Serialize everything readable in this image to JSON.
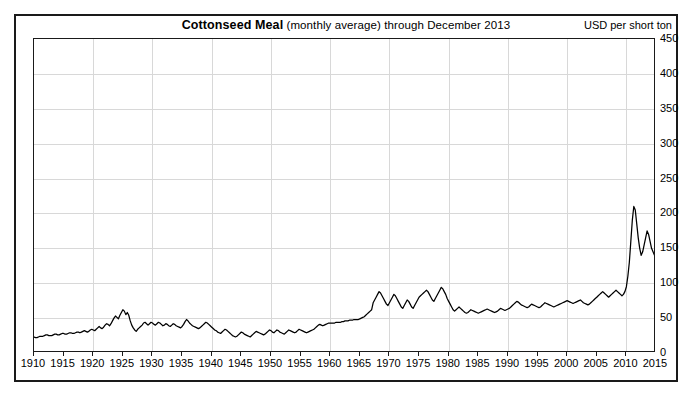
{
  "title": {
    "main": "Cottonseed Meal",
    "sub": "(monthly average) through December 2013"
  },
  "units_label": "USD per short ton",
  "chart_data": {
    "type": "line",
    "title": "Cottonseed Meal (monthly average) through December 2013",
    "xlabel": "",
    "ylabel": "USD per short ton",
    "xlim": [
      1910,
      2015
    ],
    "ylim": [
      0,
      450
    ],
    "grid": true,
    "legend": "none",
    "series_name": "Cottonseed Meal monthly average price",
    "x_ticks": [
      1910,
      1915,
      1920,
      1925,
      1930,
      1935,
      1940,
      1945,
      1950,
      1955,
      1960,
      1965,
      1970,
      1975,
      1980,
      1985,
      1990,
      1995,
      2000,
      2005,
      2010,
      2015
    ],
    "y_ticks": [
      0,
      50,
      100,
      150,
      200,
      250,
      300,
      350,
      400,
      450
    ],
    "x_start": 1910.0,
    "x_step": 0.25,
    "values": [
      23,
      22,
      22,
      23,
      24,
      24,
      24,
      25,
      26,
      26,
      25,
      25,
      25,
      26,
      27,
      27,
      26,
      26,
      27,
      28,
      28,
      27,
      27,
      28,
      29,
      29,
      28,
      28,
      29,
      30,
      30,
      29,
      30,
      31,
      32,
      31,
      30,
      31,
      33,
      34,
      33,
      32,
      34,
      36,
      38,
      36,
      35,
      37,
      40,
      42,
      41,
      39,
      42,
      46,
      50,
      53,
      51,
      49,
      54,
      58,
      62,
      60,
      55,
      58,
      54,
      46,
      40,
      36,
      33,
      31,
      34,
      36,
      38,
      40,
      43,
      44,
      42,
      40,
      42,
      44,
      43,
      41,
      40,
      42,
      44,
      43,
      41,
      39,
      40,
      42,
      41,
      39,
      38,
      40,
      42,
      41,
      39,
      38,
      37,
      36,
      38,
      41,
      45,
      48,
      46,
      43,
      41,
      39,
      38,
      37,
      36,
      35,
      36,
      38,
      40,
      42,
      44,
      43,
      41,
      39,
      37,
      35,
      33,
      32,
      30,
      29,
      28,
      30,
      32,
      34,
      33,
      31,
      29,
      27,
      25,
      24,
      23,
      24,
      26,
      28,
      30,
      29,
      27,
      26,
      25,
      24,
      23,
      25,
      27,
      29,
      31,
      30,
      29,
      28,
      27,
      26,
      27,
      29,
      31,
      33,
      32,
      30,
      29,
      31,
      33,
      32,
      30,
      29,
      28,
      27,
      29,
      31,
      33,
      32,
      31,
      30,
      29,
      30,
      32,
      34,
      33,
      32,
      31,
      30,
      29,
      30,
      31,
      32,
      33,
      34,
      36,
      38,
      40,
      41,
      40,
      39,
      40,
      41,
      42,
      43,
      43,
      43,
      43,
      43,
      44,
      44,
      44,
      44,
      45,
      45,
      46,
      46,
      46,
      47,
      47,
      47,
      48,
      48,
      48,
      48,
      49,
      50,
      51,
      52,
      54,
      56,
      58,
      60,
      62,
      72,
      76,
      80,
      84,
      88,
      86,
      82,
      78,
      74,
      70,
      68,
      72,
      76,
      80,
      84,
      82,
      78,
      74,
      70,
      66,
      64,
      68,
      72,
      76,
      74,
      70,
      66,
      64,
      68,
      72,
      76,
      80,
      82,
      84,
      86,
      88,
      90,
      88,
      84,
      80,
      76,
      74,
      78,
      82,
      86,
      90,
      94,
      92,
      88,
      84,
      78,
      74,
      70,
      66,
      62,
      60,
      62,
      64,
      66,
      64,
      62,
      60,
      58,
      57,
      58,
      60,
      62,
      61,
      60,
      59,
      58,
      57,
      58,
      59,
      60,
      61,
      62,
      63,
      62,
      61,
      60,
      59,
      58,
      59,
      60,
      62,
      64,
      63,
      62,
      61,
      62,
      63,
      64,
      66,
      68,
      70,
      72,
      74,
      73,
      71,
      69,
      68,
      67,
      66,
      65,
      66,
      68,
      70,
      69,
      68,
      67,
      66,
      65,
      66,
      68,
      70,
      72,
      71,
      70,
      69,
      68,
      67,
      66,
      67,
      68,
      69,
      70,
      71,
      72,
      73,
      74,
      75,
      74,
      73,
      72,
      71,
      72,
      73,
      74,
      75,
      76,
      74,
      72,
      71,
      70,
      69,
      70,
      72,
      74,
      76,
      78,
      80,
      82,
      84,
      86,
      88,
      86,
      84,
      82,
      80,
      82,
      84,
      86,
      88,
      90,
      88,
      86,
      84,
      82,
      84,
      88,
      95,
      110,
      130,
      160,
      190,
      210,
      205,
      185,
      165,
      150,
      140,
      145,
      155,
      165,
      175,
      170,
      160,
      150,
      145,
      140,
      138,
      142,
      150,
      160,
      168,
      165,
      158,
      150,
      145,
      142,
      140,
      138,
      140,
      145,
      155,
      170,
      185,
      195,
      200,
      195,
      185,
      175,
      168,
      160,
      155,
      150,
      148,
      152,
      160,
      170,
      178,
      185,
      190,
      185,
      175,
      165,
      160,
      158,
      162,
      170,
      180,
      190,
      198,
      205,
      210,
      205,
      195,
      185,
      178,
      170,
      165,
      168,
      175,
      185,
      195,
      205,
      215,
      225,
      228,
      220,
      208,
      195,
      182,
      170,
      160,
      152,
      148,
      145,
      148,
      155,
      165,
      175,
      185,
      195,
      205,
      218,
      228,
      225,
      215,
      200,
      188,
      178,
      172,
      168,
      165,
      162,
      158,
      152,
      145,
      138,
      130,
      122,
      115,
      112,
      118,
      125,
      132,
      140,
      148,
      155,
      160,
      158,
      152,
      148,
      145,
      148,
      152,
      158,
      165,
      172,
      178,
      182,
      185,
      180,
      172,
      165,
      158,
      152,
      148,
      150,
      155,
      162,
      170,
      178,
      185,
      192,
      198,
      205,
      210,
      205,
      196,
      186,
      176,
      168,
      162,
      158,
      155,
      152,
      150,
      152,
      156,
      160,
      164,
      168,
      170,
      168,
      164,
      160,
      156,
      152,
      150,
      152,
      156,
      160,
      165,
      170,
      175,
      172,
      168,
      164,
      160,
      158,
      156,
      158,
      162,
      168,
      175,
      180,
      184,
      180,
      175,
      168,
      162,
      158,
      155,
      158,
      162,
      166,
      170,
      172,
      170,
      166,
      162,
      158,
      155,
      152,
      150,
      152,
      155,
      158,
      162,
      166,
      170,
      168,
      164,
      160,
      156,
      152,
      150,
      148,
      146,
      145,
      148,
      152,
      156,
      162,
      168,
      175,
      182,
      188,
      195,
      200,
      198,
      192,
      185,
      178,
      172,
      166,
      160,
      155,
      150,
      145,
      140,
      136,
      132,
      130,
      128,
      126,
      125,
      126,
      128,
      132,
      136,
      140,
      142,
      140,
      136,
      132,
      130,
      132,
      136,
      140,
      145,
      150,
      155,
      158,
      155,
      150,
      145,
      140,
      136,
      132,
      130,
      128,
      126,
      125,
      124,
      122,
      120,
      118,
      116,
      115,
      114,
      116,
      118,
      120,
      122,
      124,
      126,
      125,
      123,
      120,
      118,
      116,
      115,
      118,
      122,
      128,
      135,
      142,
      150,
      158,
      165,
      172,
      178,
      182,
      180,
      175,
      168,
      160,
      152,
      145,
      140,
      136,
      132,
      130,
      128,
      126,
      125,
      128,
      132,
      138,
      145,
      152,
      160,
      168,
      172,
      168,
      160,
      152,
      145,
      140,
      138,
      140,
      145,
      152,
      160,
      170,
      180,
      190,
      198,
      205,
      210,
      208,
      200,
      190,
      180,
      172,
      168,
      172,
      180,
      192,
      205,
      218,
      230,
      240,
      248,
      252,
      248,
      238,
      225,
      212,
      200,
      190,
      182,
      178,
      180,
      188,
      200,
      215,
      230,
      248,
      265,
      282,
      298,
      308,
      302,
      288,
      270,
      252,
      238,
      225,
      215,
      208,
      205,
      208,
      215,
      228,
      245,
      265,
      285,
      300,
      295,
      278,
      255,
      232,
      212,
      198,
      188,
      182,
      180,
      185,
      195,
      210,
      228,
      248,
      270,
      292,
      315,
      338,
      358,
      375,
      390,
      402,
      406,
      398,
      382,
      360,
      335,
      310,
      288,
      272,
      262,
      258,
      262,
      275,
      295,
      318,
      340,
      358,
      368,
      362,
      348,
      330,
      312,
      298
    ]
  },
  "axes": {
    "y_tick_labels": [
      "450",
      "400",
      "350",
      "300",
      "250",
      "200",
      "150",
      "100",
      "50",
      "0"
    ],
    "x_tick_labels": [
      "1910",
      "1915",
      "1920",
      "1925",
      "1930",
      "1935",
      "1940",
      "1945",
      "1950",
      "1955",
      "1960",
      "1965",
      "1970",
      "1975",
      "1980",
      "1985",
      "1990",
      "1995",
      "2000",
      "2005",
      "2010",
      "2015"
    ]
  },
  "colors": {
    "series": "#000000",
    "grid": "#d8d8d8",
    "frame": "#1a1a1a",
    "background": "#ffffff"
  }
}
